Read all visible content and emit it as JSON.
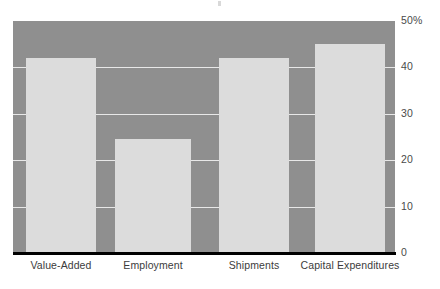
{
  "chart_data": {
    "type": "bar",
    "title": "",
    "subtitle": "",
    "xlabel": "",
    "ylabel": "",
    "categories": [
      "Value-Added",
      "Employment",
      "Shipments",
      "Capital Expenditures"
    ],
    "values": [
      42,
      24.5,
      42,
      45
    ],
    "ylim": [
      0,
      50
    ],
    "yticks": [
      0,
      10,
      20,
      30,
      40,
      50
    ],
    "ytick_labels": [
      "0",
      "10",
      "20",
      "30",
      "40",
      "50%"
    ],
    "unit": "%",
    "grid": true,
    "legend": null,
    "legend_position": "none",
    "series": [
      {
        "name": "Share",
        "values": [
          42,
          24.5,
          42,
          45
        ]
      }
    ],
    "colors": {
      "plot_background": "#8f8f8f",
      "bar_fill": "#dcdcdc",
      "gridline": "#e8e8e8",
      "axis_line": "#000000",
      "tick_label": "#4a4a4a",
      "category_label": "#3c3c3c",
      "page_background": "#ffffff"
    }
  }
}
